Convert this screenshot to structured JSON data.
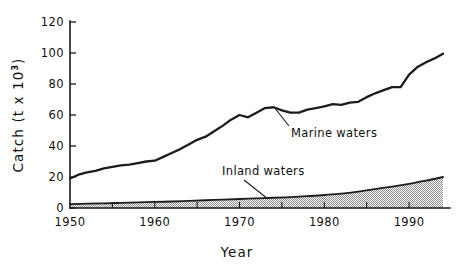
{
  "chart_data": {
    "type": "area",
    "title": "",
    "xlabel": "Year",
    "ylabel": "Catch (t x 10³)",
    "ylabel_main": "Catch  (t x 10",
    "ylabel_sup": "3",
    "ylabel_tail": ")",
    "xlim": [
      1950,
      1994
    ],
    "ylim": [
      0,
      120
    ],
    "grid": false,
    "legend_position": "inline-annotation",
    "x_tick_labels": [
      "1950",
      "1960",
      "1970",
      "1980",
      "1990"
    ],
    "x_tick_values": [
      1950,
      1960,
      1970,
      1980,
      1990
    ],
    "x_minor_tick_values": [
      1955,
      1960,
      1965,
      1970,
      1975,
      1980,
      1985,
      1990
    ],
    "y_tick_labels": [
      "0",
      "20",
      "40",
      "60",
      "80",
      "100",
      "120"
    ],
    "y_tick_values": [
      0,
      20,
      40,
      60,
      80,
      100,
      120
    ],
    "series": [
      {
        "name": "Marine waters",
        "label": "Marine waters",
        "style": "line",
        "color": "#1c1c1c",
        "x": [
          1950,
          1951,
          1952,
          1953,
          1954,
          1955,
          1956,
          1957,
          1958,
          1959,
          1960,
          1961,
          1962,
          1963,
          1964,
          1965,
          1966,
          1967,
          1968,
          1969,
          1970,
          1971,
          1972,
          1973,
          1974,
          1975,
          1976,
          1977,
          1978,
          1979,
          1980,
          1981,
          1982,
          1983,
          1984,
          1985,
          1986,
          1987,
          1988,
          1989,
          1990,
          1991,
          1992,
          1993,
          1994
        ],
        "values": [
          19.0,
          21.5,
          23.0,
          24.0,
          25.5,
          26.5,
          27.5,
          28.0,
          29.0,
          30.0,
          30.5,
          33.0,
          35.5,
          38.0,
          41.0,
          44.0,
          46.0,
          49.5,
          53.0,
          57.0,
          60.0,
          58.5,
          61.5,
          64.5,
          65.0,
          63.0,
          61.5,
          61.5,
          63.5,
          64.5,
          65.5,
          67.0,
          66.5,
          68.0,
          68.5,
          71.5,
          74.0,
          76.0,
          78.0,
          78.0,
          86.0,
          91.0,
          94.0,
          96.5,
          99.5
        ]
      },
      {
        "name": "Inland waters",
        "label": "Inland waters",
        "style": "area-stippled",
        "color": "#1c1c1c",
        "fill": "stipple",
        "x": [
          1950,
          1952,
          1954,
          1956,
          1958,
          1960,
          1962,
          1964,
          1966,
          1968,
          1970,
          1972,
          1974,
          1976,
          1978,
          1980,
          1982,
          1984,
          1986,
          1988,
          1990,
          1992,
          1994
        ],
        "values": [
          2.5,
          2.8,
          3.0,
          3.3,
          3.6,
          3.9,
          4.2,
          4.6,
          5.0,
          5.4,
          5.8,
          6.2,
          6.6,
          7.0,
          7.6,
          8.4,
          9.3,
          10.6,
          12.2,
          13.8,
          15.6,
          17.6,
          20.0
        ]
      }
    ],
    "annotations": [
      {
        "text": "Marine waters",
        "x_px": 291,
        "y_px": 132,
        "anchor": "start"
      },
      {
        "text": "Inland waters",
        "x_px": 222,
        "y_px": 176,
        "anchor": "start"
      }
    ]
  }
}
